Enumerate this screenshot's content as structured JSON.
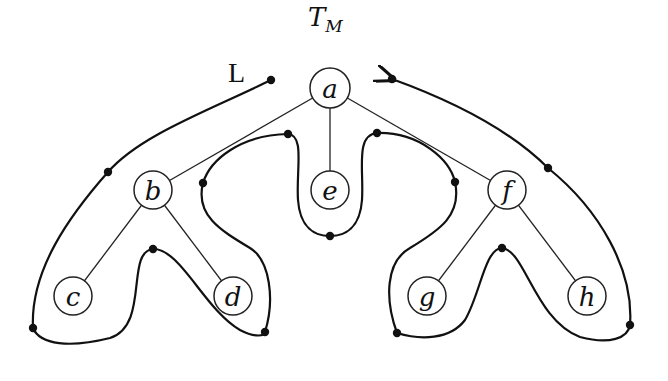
{
  "title": {
    "main": "T",
    "sub": "M"
  },
  "tour_label": "L",
  "colors": {
    "ink": "#111111",
    "background": "#ffffff"
  },
  "nodes": [
    {
      "id": "a",
      "label": "a",
      "x": 330,
      "y": 88
    },
    {
      "id": "b",
      "label": "b",
      "x": 153,
      "y": 190
    },
    {
      "id": "e",
      "label": "e",
      "x": 330,
      "y": 190
    },
    {
      "id": "f",
      "label": "f",
      "x": 507,
      "y": 190
    },
    {
      "id": "c",
      "label": "c",
      "x": 73,
      "y": 296
    },
    {
      "id": "d",
      "label": "d",
      "x": 233,
      "y": 296
    },
    {
      "id": "g",
      "label": "g",
      "x": 427,
      "y": 296
    },
    {
      "id": "h",
      "label": "h",
      "x": 587,
      "y": 296
    }
  ],
  "edges": [
    [
      "a",
      "b"
    ],
    [
      "a",
      "e"
    ],
    [
      "a",
      "f"
    ],
    [
      "b",
      "c"
    ],
    [
      "b",
      "d"
    ],
    [
      "f",
      "g"
    ],
    [
      "f",
      "h"
    ]
  ],
  "tour_dots": [
    [
      271,
      80
    ],
    [
      108,
      172
    ],
    [
      33,
      328
    ],
    [
      153,
      249
    ],
    [
      265,
      332
    ],
    [
      203,
      183
    ],
    [
      288,
      134
    ],
    [
      330,
      236
    ],
    [
      377,
      133
    ],
    [
      455,
      182
    ],
    [
      397,
      333
    ],
    [
      502,
      248
    ],
    [
      630,
      325
    ],
    [
      548,
      168
    ],
    [
      392,
      79
    ]
  ]
}
